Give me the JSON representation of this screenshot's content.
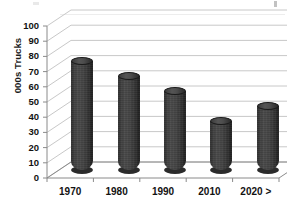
{
  "chart_data": {
    "type": "bar",
    "title": "",
    "subtitle": "",
    "xlabel": "",
    "ylabel": "000s Trucks",
    "categories": [
      "1970",
      "1980",
      "1990",
      "2010",
      "2020 >"
    ],
    "values": [
      72,
      62,
      52,
      32,
      42
    ],
    "series": [
      {
        "name": "000s Trucks",
        "values": [
          72,
          62,
          52,
          32,
          42
        ]
      }
    ],
    "ylim": [
      0,
      100
    ],
    "ytick_labels": [
      "0",
      "10",
      "20",
      "30",
      "40",
      "50",
      "60",
      "70",
      "80",
      "90",
      "100"
    ],
    "ytick_values": [
      0,
      10,
      20,
      30,
      40,
      50,
      60,
      70,
      80,
      90,
      100
    ],
    "grid": true,
    "grid_axis": "y",
    "legend": false,
    "legend_position": "none",
    "style_3d": true,
    "bar_shape": "cylinder",
    "annotations": []
  },
  "colors": {
    "background": "#ffffff",
    "bar_fill": "#3d3d3d",
    "bar_highlight": "#555555",
    "bar_shadow": "#1f1f1f",
    "gridline": "#c8c8c8",
    "axis_line": "#8a8a8a",
    "text": "#121212"
  },
  "axes": {
    "y_title": "000s Trucks",
    "y_ticks": [
      {
        "label": "100",
        "value": 100
      },
      {
        "label": "90",
        "value": 90
      },
      {
        "label": "80",
        "value": 80
      },
      {
        "label": "70",
        "value": 70
      },
      {
        "label": "60",
        "value": 60
      },
      {
        "label": "50",
        "value": 50
      },
      {
        "label": "40",
        "value": 40
      },
      {
        "label": "30",
        "value": 30
      },
      {
        "label": "20",
        "value": 20
      },
      {
        "label": "10",
        "value": 10
      },
      {
        "label": "0",
        "value": 0
      }
    ],
    "x_ticks": [
      {
        "label": "1970"
      },
      {
        "label": "1980"
      },
      {
        "label": "1990"
      },
      {
        "label": "2010"
      },
      {
        "label": "2020 >"
      }
    ]
  },
  "bars": [
    {
      "category": "1970",
      "value": 72
    },
    {
      "category": "1980",
      "value": 62
    },
    {
      "category": "1990",
      "value": 52
    },
    {
      "category": "2010",
      "value": 32
    },
    {
      "category": "2020 >",
      "value": 42
    }
  ]
}
